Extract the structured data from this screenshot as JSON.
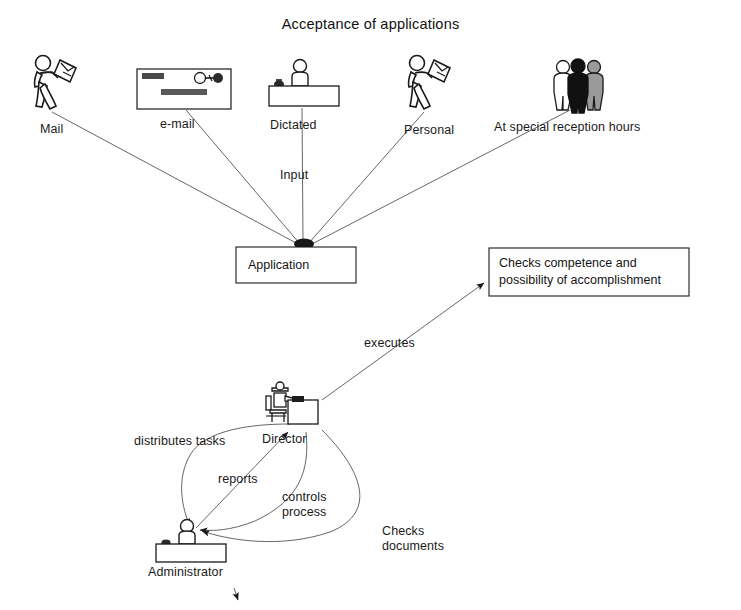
{
  "diagram": {
    "title": "Acceptance of applications",
    "type": "business-process-flow"
  },
  "sources": [
    {
      "id": "mail",
      "label": "Mail",
      "icon": "walking-person-with-letter-icon",
      "label_x": 40,
      "label_y": 122,
      "icon_x": 28,
      "icon_y": 52
    },
    {
      "id": "email",
      "label": "e-mail",
      "icon": "screen-window-icon",
      "label_x": 160,
      "label_y": 117,
      "icon_x": 136,
      "icon_y": 68
    },
    {
      "id": "dictated",
      "label": "Dictated",
      "icon": "person-at-counter-with-phone-icon",
      "label_x": 270,
      "label_y": 118,
      "icon_x": 268,
      "icon_y": 58
    },
    {
      "id": "personal",
      "label": "Personal",
      "icon": "walking-person-with-document-icon",
      "label_x": 404,
      "label_y": 123,
      "icon_x": 402,
      "icon_y": 52
    },
    {
      "id": "reception",
      "label": "At special reception hours",
      "icon": "three-people-group-icon",
      "label_x": 494,
      "label_y": 120,
      "icon_x": 548,
      "icon_y": 58
    }
  ],
  "nodes": {
    "application": {
      "label": "Application",
      "x": 236,
      "y": 247,
      "w": 120,
      "h": 36
    },
    "checks_box": {
      "label": "Checks competence and\npossibility of accomplishment",
      "line1": "Checks competence and",
      "line2": "possibility of accomplishment",
      "x": 489,
      "y": 248,
      "w": 200,
      "h": 48
    },
    "director": {
      "label": "Director",
      "icon": "person-at-desk-with-computer-icon",
      "label_x": 262,
      "label_y": 432,
      "icon_x": 262,
      "icon_y": 382
    },
    "administrator": {
      "label": "Administrator",
      "icon": "person-at-counter-icon",
      "label_x": 148,
      "label_y": 565,
      "icon_x": 155,
      "icon_y": 518
    }
  },
  "edge_labels": [
    {
      "id": "input",
      "text": "Input",
      "x": 280,
      "y": 168
    },
    {
      "id": "executes",
      "text": "executes",
      "x": 364,
      "y": 336
    },
    {
      "id": "distributes_tasks",
      "text": "distributes tasks",
      "x": 134,
      "y": 434
    },
    {
      "id": "reports",
      "text": "reports",
      "x": 218,
      "y": 472
    },
    {
      "id": "controls_process",
      "text": "controls process",
      "line1": "controls",
      "line2": "process",
      "x": 282,
      "y": 490
    },
    {
      "id": "checks_documents",
      "text": "Checks documents",
      "line1": "Checks",
      "line2": "documents",
      "x": 382,
      "y": 524
    }
  ],
  "colors": {
    "ink": "#1a1a1a",
    "line": "#555555",
    "fill_white": "#ffffff",
    "fill_black": "#111111",
    "fill_gray": "#9a9a9a",
    "background": "#ffffff"
  }
}
